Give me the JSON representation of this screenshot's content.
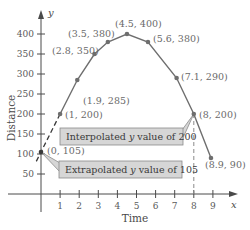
{
  "chart_data": {
    "type": "line",
    "title": "",
    "xlabel": "Time",
    "ylabel": "Distance",
    "x_axis_var": "x",
    "y_axis_var": "y",
    "xlim": [
      0,
      10
    ],
    "ylim": [
      0,
      440
    ],
    "x_ticks": [
      1,
      2,
      3,
      4,
      5,
      6,
      7,
      8,
      9
    ],
    "y_ticks": [
      50,
      100,
      150,
      200,
      250,
      300,
      350,
      400
    ],
    "grid": false,
    "legend": null,
    "series": [
      {
        "name": "Distance vs Time",
        "points": [
          {
            "x": 1,
            "y": 200,
            "label": "(1, 200)"
          },
          {
            "x": 1.9,
            "y": 285,
            "label": "(1.9, 285)"
          },
          {
            "x": 2.8,
            "y": 350,
            "label": "(2.8, 350)"
          },
          {
            "x": 3.5,
            "y": 380,
            "label": "(3.5, 380)"
          },
          {
            "x": 4.5,
            "y": 400,
            "label": "(4.5, 400)"
          },
          {
            "x": 5.6,
            "y": 380,
            "label": "(5.6, 380)"
          },
          {
            "x": 7.1,
            "y": 290,
            "label": "(7.1, 290)"
          },
          {
            "x": 8,
            "y": 200,
            "label": "(8, 200)"
          },
          {
            "x": 8.9,
            "y": 90,
            "label": "(8.9, 90)"
          }
        ]
      },
      {
        "name": "Extrapolation (dashed)",
        "points": [
          {
            "x": 1,
            "y": 200
          },
          {
            "x": 0,
            "y": 105,
            "label": "(0, 105)"
          }
        ]
      }
    ],
    "annotations": [
      {
        "text_prefix": "Interpolated ",
        "var": "y",
        "text_suffix": " value of 200",
        "points_to": {
          "x": 8,
          "y": 200
        }
      },
      {
        "text_prefix": "Extrapolated ",
        "var": "y",
        "text_suffix": " value of 105",
        "points_to": {
          "x": 0,
          "y": 105
        }
      }
    ],
    "colors": {
      "line": "#6e6e6e",
      "marker": "#6e6e6e",
      "axis": "#4a4a4a",
      "annotation_box_fill": "#d6d6d6",
      "annotation_box_stroke": "#8a8a8a"
    }
  },
  "labels": {
    "xlabel": "Time",
    "ylabel": "Distance",
    "x_var": "x",
    "y_var": "y",
    "origin_label": "(0, 105)",
    "interp_prefix": "Interpolated ",
    "interp_var": "y",
    "interp_suffix": " value of 200",
    "extrap_prefix": "Extrapolated ",
    "extrap_var": "y",
    "extrap_suffix": " value of 105"
  }
}
